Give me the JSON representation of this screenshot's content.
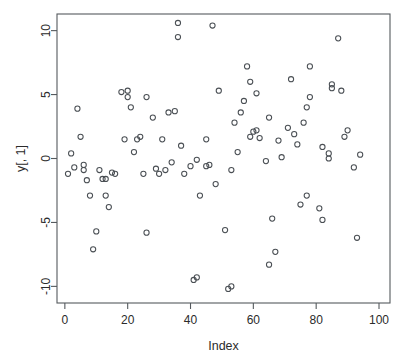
{
  "chart_data": {
    "type": "scatter",
    "title": "",
    "xlabel": "Index",
    "ylabel": "y[, 1]",
    "xlim": [
      -2.5,
      103.5
    ],
    "ylim": [
      -11.3,
      11.3
    ],
    "xticks": [
      0,
      20,
      40,
      60,
      80,
      100
    ],
    "yticks": [
      -10,
      -5,
      0,
      5,
      10
    ],
    "xtick_labels": [
      "0",
      "20",
      "40",
      "60",
      "80",
      "100"
    ],
    "ytick_labels": [
      "-10",
      "-5",
      "0",
      "5",
      "10"
    ],
    "grid": false,
    "legend": null,
    "marker": "open-circle",
    "marker_color": "#4a4f54",
    "background_color": "#ffffff",
    "frame_color": "#555a5e",
    "points": [
      {
        "x": 1,
        "y": -1.2
      },
      {
        "x": 2,
        "y": 0.4
      },
      {
        "x": 3,
        "y": -0.7
      },
      {
        "x": 4,
        "y": 3.9
      },
      {
        "x": 5,
        "y": 1.7
      },
      {
        "x": 6,
        "y": -0.9
      },
      {
        "x": 6,
        "y": -0.5
      },
      {
        "x": 7,
        "y": -1.7
      },
      {
        "x": 8,
        "y": -2.9
      },
      {
        "x": 9,
        "y": -7.1
      },
      {
        "x": 10,
        "y": -5.7
      },
      {
        "x": 11,
        "y": -0.9
      },
      {
        "x": 12,
        "y": -1.6
      },
      {
        "x": 13,
        "y": -2.9
      },
      {
        "x": 13,
        "y": -1.6
      },
      {
        "x": 14,
        "y": -3.8
      },
      {
        "x": 15,
        "y": -1.1
      },
      {
        "x": 16,
        "y": -1.2
      },
      {
        "x": 18,
        "y": 5.2
      },
      {
        "x": 19,
        "y": 1.5
      },
      {
        "x": 20,
        "y": 4.8
      },
      {
        "x": 20,
        "y": 5.3
      },
      {
        "x": 21,
        "y": 4.0
      },
      {
        "x": 22,
        "y": 0.5
      },
      {
        "x": 23,
        "y": 1.5
      },
      {
        "x": 24,
        "y": 1.7
      },
      {
        "x": 25,
        "y": -1.2
      },
      {
        "x": 26,
        "y": 4.8
      },
      {
        "x": 26,
        "y": -5.8
      },
      {
        "x": 28,
        "y": 3.2
      },
      {
        "x": 29,
        "y": -0.8
      },
      {
        "x": 30,
        "y": -1.2
      },
      {
        "x": 31,
        "y": 1.5
      },
      {
        "x": 32,
        "y": -0.9
      },
      {
        "x": 33,
        "y": 3.6
      },
      {
        "x": 34,
        "y": -0.3
      },
      {
        "x": 35,
        "y": 3.7
      },
      {
        "x": 36,
        "y": 10.6
      },
      {
        "x": 36,
        "y": 9.5
      },
      {
        "x": 37,
        "y": 1.0
      },
      {
        "x": 38,
        "y": -1.2
      },
      {
        "x": 40,
        "y": -0.6
      },
      {
        "x": 41,
        "y": -9.5
      },
      {
        "x": 42,
        "y": -0.1
      },
      {
        "x": 42,
        "y": -9.3
      },
      {
        "x": 43,
        "y": -2.9
      },
      {
        "x": 45,
        "y": -0.6
      },
      {
        "x": 45,
        "y": 1.5
      },
      {
        "x": 46,
        "y": -0.5
      },
      {
        "x": 47,
        "y": 10.4
      },
      {
        "x": 48,
        "y": -2.0
      },
      {
        "x": 49,
        "y": 5.3
      },
      {
        "x": 51,
        "y": -5.6
      },
      {
        "x": 52,
        "y": -10.2
      },
      {
        "x": 53,
        "y": -10.0
      },
      {
        "x": 53,
        "y": -0.9
      },
      {
        "x": 54,
        "y": 2.8
      },
      {
        "x": 55,
        "y": 0.5
      },
      {
        "x": 56,
        "y": 3.6
      },
      {
        "x": 57,
        "y": 4.5
      },
      {
        "x": 58,
        "y": 7.2
      },
      {
        "x": 59,
        "y": 6.0
      },
      {
        "x": 59,
        "y": 1.7
      },
      {
        "x": 60,
        "y": 2.1
      },
      {
        "x": 61,
        "y": 2.2
      },
      {
        "x": 61,
        "y": 5.1
      },
      {
        "x": 62,
        "y": 1.6
      },
      {
        "x": 64,
        "y": -0.2
      },
      {
        "x": 65,
        "y": 3.2
      },
      {
        "x": 65,
        "y": -8.3
      },
      {
        "x": 66,
        "y": -4.7
      },
      {
        "x": 67,
        "y": -7.3
      },
      {
        "x": 68,
        "y": 1.4
      },
      {
        "x": 69,
        "y": 0.1
      },
      {
        "x": 71,
        "y": 2.4
      },
      {
        "x": 72,
        "y": 6.2
      },
      {
        "x": 73,
        "y": 1.9
      },
      {
        "x": 74,
        "y": 1.1
      },
      {
        "x": 75,
        "y": -3.6
      },
      {
        "x": 76,
        "y": 2.8
      },
      {
        "x": 77,
        "y": 4.0
      },
      {
        "x": 77,
        "y": -2.9
      },
      {
        "x": 78,
        "y": 4.8
      },
      {
        "x": 78,
        "y": 7.2
      },
      {
        "x": 81,
        "y": -3.9
      },
      {
        "x": 82,
        "y": -4.8
      },
      {
        "x": 82,
        "y": 0.9
      },
      {
        "x": 84,
        "y": 0.4
      },
      {
        "x": 84,
        "y": 0.0
      },
      {
        "x": 85,
        "y": 5.8
      },
      {
        "x": 85,
        "y": 5.5
      },
      {
        "x": 87,
        "y": 9.4
      },
      {
        "x": 88,
        "y": 5.3
      },
      {
        "x": 89,
        "y": 1.7
      },
      {
        "x": 90,
        "y": 2.2
      },
      {
        "x": 92,
        "y": -0.7
      },
      {
        "x": 93,
        "y": -6.2
      },
      {
        "x": 94,
        "y": 0.3
      }
    ]
  }
}
